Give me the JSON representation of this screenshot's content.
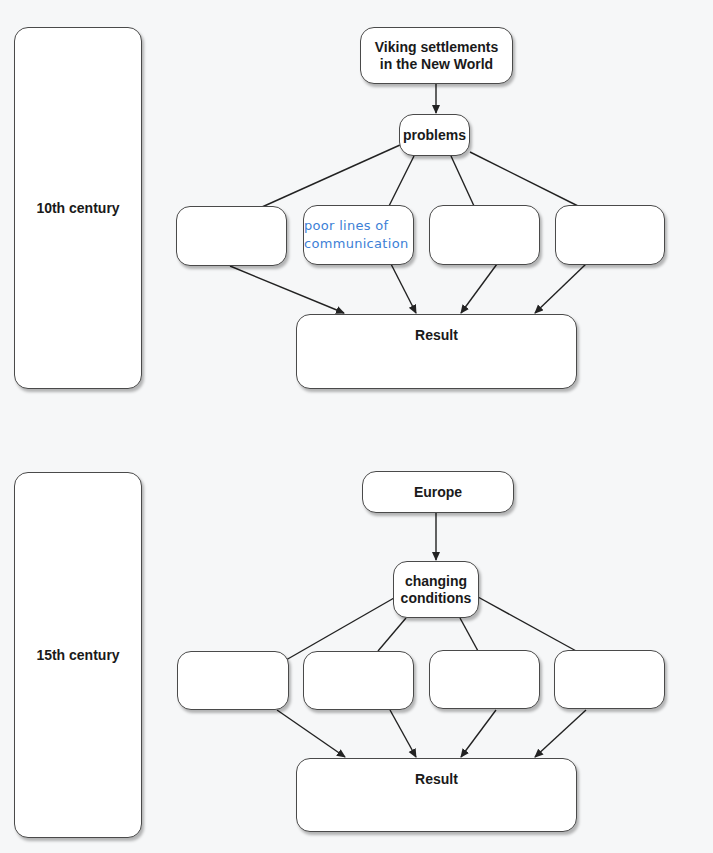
{
  "diagram": {
    "sections": [
      {
        "era_label": "10th century",
        "source_node": "Viking settlements in the New World",
        "category_node": "problems",
        "branch_boxes": [
          "",
          "poor lines of communication",
          "",
          ""
        ],
        "branch_box_filled_index": 1,
        "result_label": "Result"
      },
      {
        "era_label": "15th century",
        "source_node": "Europe",
        "category_node": "changing conditions",
        "branch_boxes": [
          "",
          "",
          "",
          ""
        ],
        "result_label": "Result"
      }
    ],
    "colors": {
      "background": "#f6f7f8",
      "box_fill": "#ffffff",
      "box_border": "#4a4a4a",
      "line": "#222222",
      "handwriting": "#3d7fd6"
    }
  }
}
